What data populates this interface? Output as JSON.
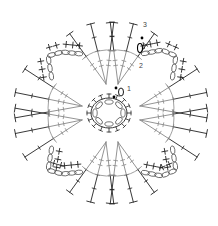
{
  "diagram": {
    "type": "crochet-chart",
    "colors": {
      "background": "#ffffff",
      "stitch_dark": "#222222",
      "stitch_light": "#888888",
      "chain": "#555555"
    },
    "labels": [
      {
        "id": "round-1",
        "text": "1",
        "x": 127,
        "y": 91
      },
      {
        "id": "round-2",
        "text": "2",
        "x": 139,
        "y": 68
      },
      {
        "id": "round-3",
        "text": "3",
        "x": 143,
        "y": 27
      }
    ],
    "markers": [
      {
        "id": "start-dot-1",
        "x": 116,
        "y": 88
      },
      {
        "id": "start-dot-2",
        "x": 142,
        "y": 38
      },
      {
        "id": "ring-dot",
        "x": 114,
        "y": 97
      }
    ],
    "center_ring": {
      "cx": 109,
      "cy": 113,
      "rx": 18,
      "ry": 14
    },
    "petals": [
      "top",
      "right",
      "bottom",
      "left"
    ]
  }
}
